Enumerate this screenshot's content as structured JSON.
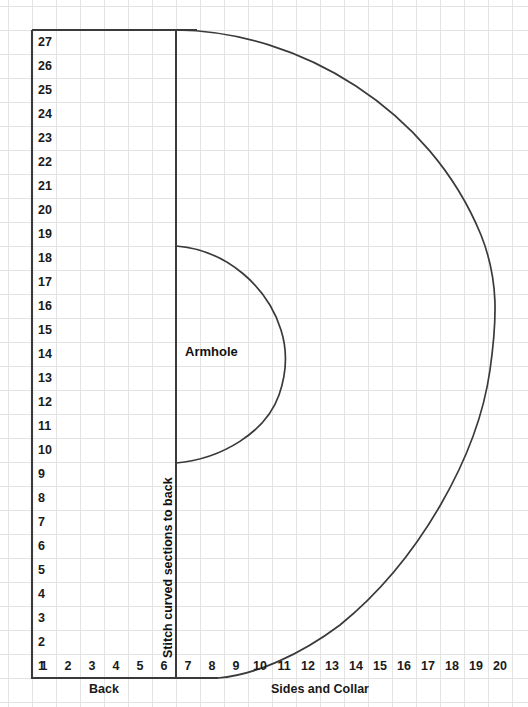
{
  "chart_data": {
    "type": "table",
    "xlabel": "",
    "ylabel": "",
    "grid": true,
    "cell_size": 24,
    "origin": {
      "x": 32,
      "y": 678
    },
    "x_ticks": [
      "1",
      "2",
      "3",
      "4",
      "5",
      "6",
      "7",
      "8",
      "9",
      "10",
      "11",
      "12",
      "13",
      "14",
      "15",
      "16",
      "17",
      "18",
      "19",
      "20"
    ],
    "y_ticks": [
      "1",
      "2",
      "3",
      "4",
      "5",
      "6",
      "7",
      "8",
      "9",
      "10",
      "11",
      "12",
      "13",
      "14",
      "15",
      "16",
      "17",
      "18",
      "19",
      "20",
      "21",
      "22",
      "23",
      "24",
      "25",
      "26",
      "27"
    ],
    "xlim": [
      1,
      20
    ],
    "ylim": [
      1,
      27
    ],
    "annotations": [
      {
        "text": "Armhole",
        "x": 7.8,
        "y": 14
      },
      {
        "text": "Stitch curved sections to back",
        "x": 6.0,
        "y": 8
      },
      {
        "text": "Back",
        "x": 3.5,
        "y": 0
      },
      {
        "text": "Sides and Collar",
        "x": 12.5,
        "y": 0
      }
    ],
    "shapes": [
      {
        "name": "back-panel-left-edge",
        "type": "line",
        "from": [
          1,
          1
        ],
        "to": [
          1,
          27
        ]
      },
      {
        "name": "back-panel-top-edge",
        "type": "line",
        "from": [
          1,
          27
        ],
        "to": [
          7,
          27
        ]
      },
      {
        "name": "back-panel-bottom-edge",
        "type": "line",
        "from": [
          1,
          1
        ],
        "to": [
          9,
          1
        ]
      },
      {
        "name": "stitch-divider",
        "type": "line",
        "from": [
          7,
          1
        ],
        "to": [
          7,
          27
        ]
      },
      {
        "name": "outer-body-curve",
        "type": "curve",
        "from": [
          7,
          27
        ],
        "apex": [
          20,
          15.5
        ],
        "to": [
          9,
          1
        ]
      },
      {
        "name": "armhole-curve",
        "type": "curve",
        "from": [
          7,
          19
        ],
        "apex": [
          11.5,
          14.5
        ],
        "to": [
          7,
          10
        ]
      }
    ]
  },
  "labels": {
    "armhole": "Armhole",
    "stitch_note": "Stitch curved sections to back",
    "section_back": "Back",
    "section_sides_collar": "Sides and Collar"
  },
  "colors": {
    "background": "#ffffff",
    "grid_line": "#e3e3e3",
    "outline": "#3a3a3c",
    "text": "#1a1a1a"
  }
}
